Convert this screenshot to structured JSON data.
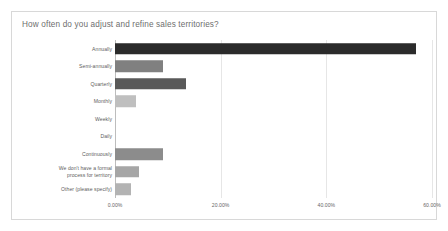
{
  "card": {
    "title": "How often do you adjust and refine sales territories?"
  },
  "chart_data": {
    "type": "bar",
    "orientation": "horizontal",
    "title": "How often do you adjust and refine sales territories?",
    "xlabel": "",
    "ylabel": "",
    "xlim": [
      0,
      60
    ],
    "grid": "vertical",
    "legend": "none",
    "tick_labels": [
      "0.00%",
      "20.00%",
      "40.00%",
      "60.00%"
    ],
    "tick_values": [
      0,
      20,
      40,
      60
    ],
    "categories": [
      "Annually",
      "Semi-annually",
      "Quarterly",
      "Monthly",
      "Weekly",
      "Daily",
      "Continuously",
      "We don't have a formal process for territory",
      "Other (please specify)"
    ],
    "values": [
      57.0,
      9.0,
      13.5,
      4.0,
      0.0,
      0.0,
      9.0,
      4.5,
      3.0
    ],
    "value_labels": [
      "57.00%",
      "9.00%",
      "13.50%",
      "4.00%",
      "0.00%",
      "0.00%",
      "9.00%",
      "4.50%",
      "3.00%"
    ],
    "colors": [
      "#2b2b2b",
      "#808080",
      "#595959",
      "#bfbfbf",
      "#bfbfbf",
      "#bfbfbf",
      "#8c8c8c",
      "#a6a6a6",
      "#b3b3b3"
    ]
  },
  "bars": [
    {
      "label": "Annually",
      "label2": "",
      "value": 57.0,
      "color": "#2b2b2b"
    },
    {
      "label": "Semi-annually",
      "label2": "",
      "value": 9.0,
      "color": "#808080"
    },
    {
      "label": "Quarterly",
      "label2": "",
      "value": 13.5,
      "color": "#595959"
    },
    {
      "label": "Monthly",
      "label2": "",
      "value": 4.0,
      "color": "#bfbfbf"
    },
    {
      "label": "Weekly",
      "label2": "",
      "value": 0.0,
      "color": "#bfbfbf"
    },
    {
      "label": "Daily",
      "label2": "",
      "value": 0.0,
      "color": "#bfbfbf"
    },
    {
      "label": "Continuously",
      "label2": "",
      "value": 9.0,
      "color": "#8c8c8c"
    },
    {
      "label": "We don't have a formal",
      "label2": "process for territory",
      "value": 4.5,
      "color": "#a6a6a6"
    },
    {
      "label": "Other (please specify)",
      "label2": "",
      "value": 3.0,
      "color": "#b3b3b3"
    }
  ],
  "ticks": [
    {
      "label": "0.00%",
      "value": 0
    },
    {
      "label": "20.00%",
      "value": 20
    },
    {
      "label": "40.00%",
      "value": 40
    },
    {
      "label": "60.00%",
      "value": 60
    }
  ]
}
